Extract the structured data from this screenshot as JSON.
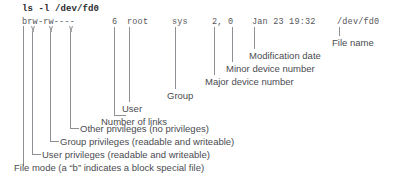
{
  "command": {
    "text": "ls -l /dev/fd0"
  },
  "listing": {
    "file_mode": "brw-rw----",
    "links": "6",
    "user": "root",
    "group": "sys",
    "device_numbers": "2, 0",
    "date": "Jan 23 19:32",
    "file_name": "/dev/fd0"
  },
  "annotations": [
    {
      "id": "file-name",
      "label": "File name"
    },
    {
      "id": "modification-date",
      "label": "Modification date"
    },
    {
      "id": "minor-device-number",
      "label": "Minor device number"
    },
    {
      "id": "major-device-number",
      "label": "Major device number"
    },
    {
      "id": "group",
      "label": "Group"
    },
    {
      "id": "user",
      "label": "User"
    },
    {
      "id": "number-of-links",
      "label": "Number of links"
    },
    {
      "id": "other-privileges",
      "label": "Other privileges (no privileges)"
    },
    {
      "id": "group-privileges",
      "label": "Group privileges (readable and writeable)"
    },
    {
      "id": "user-privileges",
      "label": "User privileges (readable and writeable)"
    },
    {
      "id": "file-mode",
      "label": "File mode (a “b” indicates a block special file)"
    }
  ],
  "colors": {
    "background": "#ffffff",
    "command_text": "#2b2b2d",
    "listing_text": "#55565a",
    "label_text": "#4a4b4f",
    "line": "#8e9095"
  }
}
